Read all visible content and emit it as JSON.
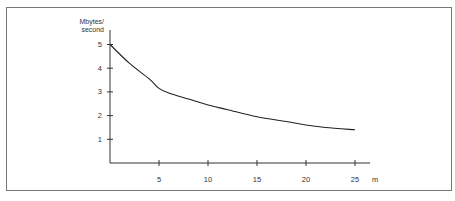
{
  "chart_data": {
    "type": "line",
    "title": "",
    "ylabel_line1": "Mbytes/",
    "ylabel_line2": "second",
    "xlabel": "m",
    "xlim": [
      0,
      27
    ],
    "ylim": [
      0,
      5.5
    ],
    "x_ticks": [
      "5",
      "10",
      "15",
      "20",
      "25"
    ],
    "y_ticks": [
      "1",
      "2",
      "3",
      "4",
      "5"
    ],
    "grid": false,
    "legend": null,
    "series": [
      {
        "name": "throughput",
        "x": [
          0,
          2,
          4,
          5,
          6,
          8,
          10,
          12,
          15,
          18,
          20,
          22,
          25
        ],
        "y": [
          5.0,
          4.2,
          3.55,
          3.15,
          2.95,
          2.7,
          2.45,
          2.25,
          1.95,
          1.75,
          1.6,
          1.5,
          1.4
        ]
      }
    ]
  }
}
